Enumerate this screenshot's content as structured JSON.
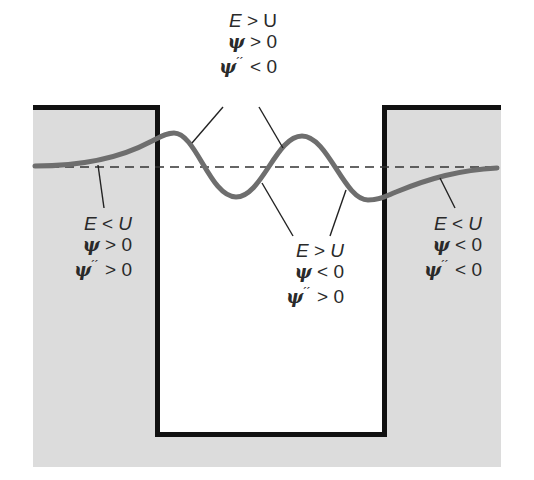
{
  "diagram": {
    "colors": {
      "barrier_fill": "#dcdcdc",
      "well_fill": "#ffffff",
      "wall_stroke": "#111111",
      "wave_stroke": "#6e6e6e",
      "energy_line": "#333333",
      "leader_line": "#222222",
      "text": "#2a2a2a"
    },
    "geometry": {
      "barrier_region": {
        "x": 33,
        "y": 105,
        "width": 468,
        "height": 362
      },
      "well": {
        "left": 158,
        "right": 384,
        "top": 107,
        "bottom": 434
      },
      "energy_level_y": 167
    },
    "labels": {
      "top": {
        "line1": {
          "lhs": "E",
          "op": " > ",
          "rhs": "U"
        },
        "line2": {
          "lhs": "ψ",
          "op": " > ",
          "rhs": "0"
        },
        "line3": {
          "lhs": "ψ",
          "prime": "´´",
          "op": " < ",
          "rhs": "0"
        }
      },
      "left": {
        "line1": {
          "lhs": "E",
          "op": " < ",
          "rhs": "U"
        },
        "line2": {
          "lhs": "ψ",
          "op": " > ",
          "rhs": "0"
        },
        "line3": {
          "lhs": "ψ",
          "prime": "´´",
          "op": " > ",
          "rhs": "0"
        }
      },
      "center": {
        "line1": {
          "lhs": "E",
          "op": " > ",
          "rhs": "U"
        },
        "line2": {
          "lhs": "ψ",
          "op": " < ",
          "rhs": "0"
        },
        "line3": {
          "lhs": "ψ",
          "prime": "´´",
          "op": " > ",
          "rhs": "0"
        }
      },
      "right": {
        "line1": {
          "lhs": "E",
          "op": " < ",
          "rhs": "U"
        },
        "line2": {
          "lhs": "ψ",
          "op": " < ",
          "rhs": "0"
        },
        "line3": {
          "lhs": "ψ",
          "prime": "´´",
          "op": " < ",
          "rhs": "0"
        }
      }
    }
  }
}
